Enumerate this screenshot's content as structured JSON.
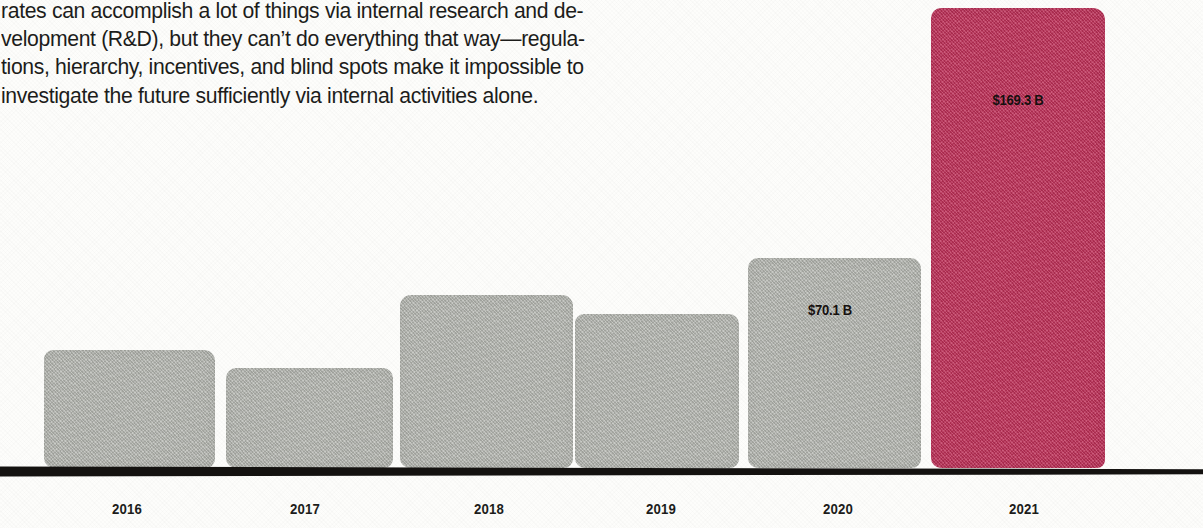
{
  "article": {
    "lines": [
      "rates can accomplish a lot of things via internal research and de-",
      "velopment (R&D), but they can’t do everything that way—regula-",
      "tions, hierarchy, incentives, and blind spots make it impossible to",
      "investigate the future sufficiently via internal activities alone."
    ]
  },
  "chart_data": {
    "type": "bar",
    "title": "",
    "subtitle": "",
    "xlabel": "",
    "ylabel": "",
    "categories": [
      "2016",
      "2017",
      "2018",
      "2019",
      "2020",
      "2021"
    ],
    "values": [
      26.0,
      23.5,
      39.0,
      35.5,
      70.1,
      169.3
    ],
    "value_unit": "$ billions",
    "data_labels": [
      "",
      "",
      "",
      "",
      "$70.1 B",
      "$169.3 B"
    ],
    "series": [
      {
        "name": "Annual value",
        "values": [
          26.0,
          23.5,
          39.0,
          35.5,
          70.1,
          169.3
        ]
      }
    ],
    "ylim": [
      0,
      185
    ],
    "grid": false,
    "legend": false,
    "highlight_category": "2021",
    "colors": {
      "bar_default": "#b2b4ae",
      "bar_highlight": "#c2315a",
      "axis": "#141210",
      "label_text": "#16100f",
      "background": "#fdfdfb"
    },
    "bar_geometry": [
      {
        "category": "2016",
        "left": 44,
        "width": 171,
        "top": 350
      },
      {
        "category": "2017",
        "left": 226,
        "width": 167,
        "top": 368
      },
      {
        "category": "2018",
        "left": 400,
        "width": 173,
        "top": 295
      },
      {
        "category": "2019",
        "left": 575,
        "width": 164,
        "top": 314
      },
      {
        "category": "2020",
        "left": 748,
        "width": 173,
        "top": 258
      },
      {
        "category": "2021",
        "left": 931,
        "width": 174,
        "top": 8
      }
    ],
    "label_geometry": [
      {
        "category": "2020",
        "left": 780,
        "top": 302,
        "width": 100
      },
      {
        "category": "2021",
        "left": 968,
        "top": 92,
        "width": 100
      }
    ],
    "tick_geometry": [
      {
        "category": "2016",
        "center": 127
      },
      {
        "category": "2017",
        "center": 305
      },
      {
        "category": "2018",
        "center": 489
      },
      {
        "category": "2019",
        "center": 661
      },
      {
        "category": "2020",
        "center": 838
      },
      {
        "category": "2021",
        "center": 1024
      }
    ]
  }
}
